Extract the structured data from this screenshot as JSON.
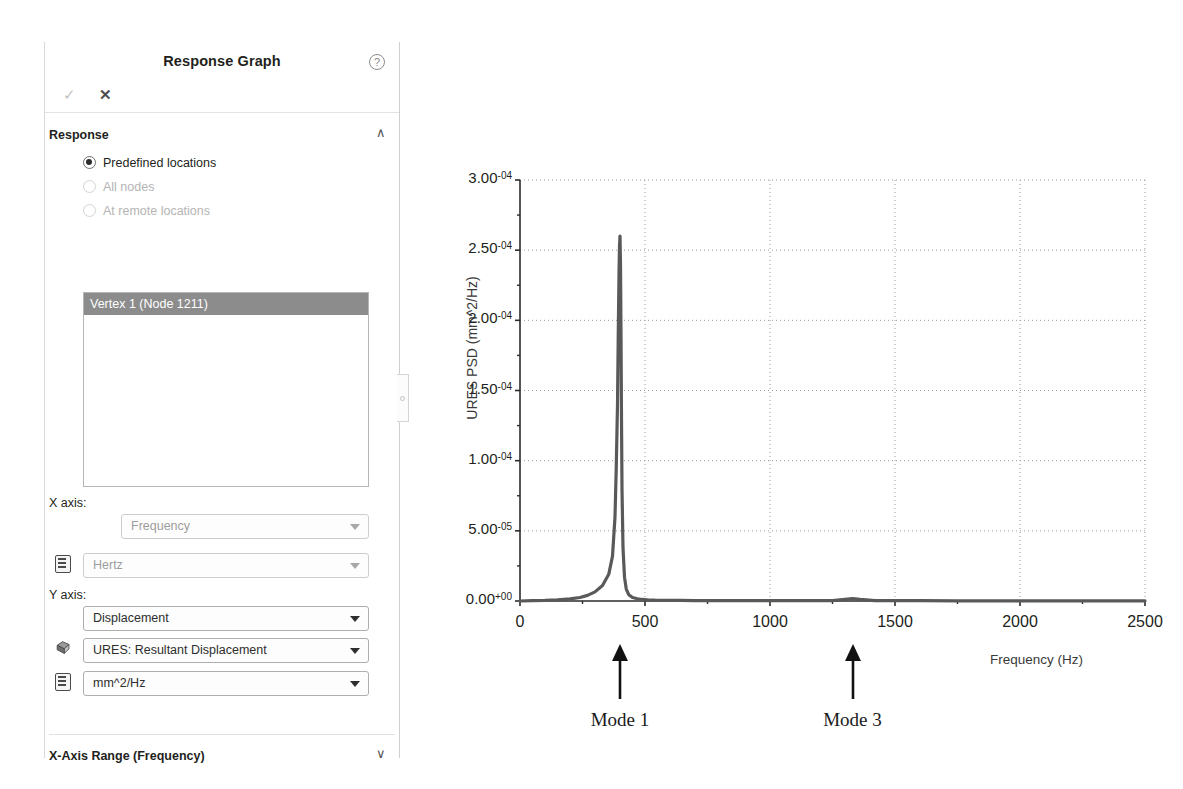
{
  "panel": {
    "title": "Response Graph",
    "help_icon": "help-circle-icon",
    "toolbar": {
      "ok_label": "✓",
      "cancel_label": "✕"
    },
    "sections": [
      {
        "label": "Response",
        "chevron": "∧"
      },
      {
        "label": "X-Axis Range  (Frequency)",
        "chevron": "∨"
      }
    ],
    "response": {
      "options": [
        {
          "label": "Predefined locations",
          "selected": true,
          "enabled": true
        },
        {
          "label": "All nodes",
          "selected": false,
          "enabled": false
        },
        {
          "label": "At remote locations",
          "selected": false,
          "enabled": false
        }
      ],
      "list_items": [
        "Vertex 1 (Node 1211)"
      ]
    },
    "x_axis": {
      "label": "X axis:",
      "quantity": "Frequency",
      "unit": "Hertz"
    },
    "y_axis": {
      "label": "Y axis:",
      "quantity": "Displacement",
      "component": "URES:   Resultant Displacement",
      "unit": "mm^2/Hz"
    }
  },
  "chart_data": {
    "type": "line",
    "title": "",
    "xlabel": "Frequency (Hz)",
    "ylabel": "URES PSD (mm^2/Hz)",
    "xlim": [
      0,
      2500
    ],
    "ylim": [
      0,
      0.0003
    ],
    "grid": true,
    "legend": null,
    "xticks": [
      0,
      500,
      1000,
      1500,
      2000,
      2500
    ],
    "xtick_labels": [
      "0",
      "500",
      "1000",
      "1500",
      "2000",
      "2500"
    ],
    "yticks": [
      0,
      5e-05,
      0.0001,
      0.00015,
      0.0002,
      0.00025,
      0.0003
    ],
    "ytick_labels": [
      {
        "mantissa": "0.00",
        "exp": "+00"
      },
      {
        "mantissa": "5.00",
        "exp": "-05"
      },
      {
        "mantissa": "1.00",
        "exp": "-04"
      },
      {
        "mantissa": "1.50",
        "exp": "-04"
      },
      {
        "mantissa": "2.00",
        "exp": "-04"
      },
      {
        "mantissa": "2.50",
        "exp": "-04"
      },
      {
        "mantissa": "3.00",
        "exp": "-04"
      }
    ],
    "series": [
      {
        "name": "URES PSD",
        "color": "#595959",
        "x": [
          0,
          50,
          100,
          150,
          200,
          240,
          270,
          300,
          330,
          355,
          370,
          380,
          385,
          390,
          393,
          396,
          398,
          400,
          402,
          404,
          406,
          408,
          412,
          418,
          425,
          435,
          450,
          470,
          490,
          510,
          540,
          580,
          640,
          700,
          780,
          860,
          950,
          1050,
          1150,
          1250,
          1300,
          1330,
          1360,
          1420,
          1500,
          1600,
          1750,
          1900,
          2050,
          2200,
          2350,
          2500
        ],
        "y": [
          0.0,
          2e-07,
          4e-07,
          8e-07,
          1.5e-06,
          2.5e-06,
          4e-06,
          6.5e-06,
          1.1e-05,
          1.9e-05,
          3.2e-05,
          6e-05,
          9.5e-05,
          0.00014,
          0.00019,
          0.000233,
          0.000253,
          0.00026,
          0.00024,
          0.00019,
          0.00013,
          8e-05,
          3.8e-05,
          1.7e-05,
          8.5e-06,
          4.5e-06,
          2.5e-06,
          1.6e-06,
          1.1e-06,
          8e-07,
          6e-07,
          5e-07,
          4e-07,
          3e-07,
          2e-07,
          2e-07,
          2e-07,
          2e-07,
          2e-07,
          3e-07,
          1.2e-06,
          1.8e-06,
          1.2e-06,
          3e-07,
          2e-07,
          2e-07,
          1e-07,
          1e-07,
          1e-07,
          1e-07,
          1e-07,
          1e-07
        ]
      }
    ],
    "annotations": [
      {
        "label": "Mode 1",
        "x": 400,
        "arrow": "up-arrow-icon"
      },
      {
        "label": "Mode 3",
        "x": 1330,
        "arrow": "up-arrow-icon"
      }
    ]
  }
}
